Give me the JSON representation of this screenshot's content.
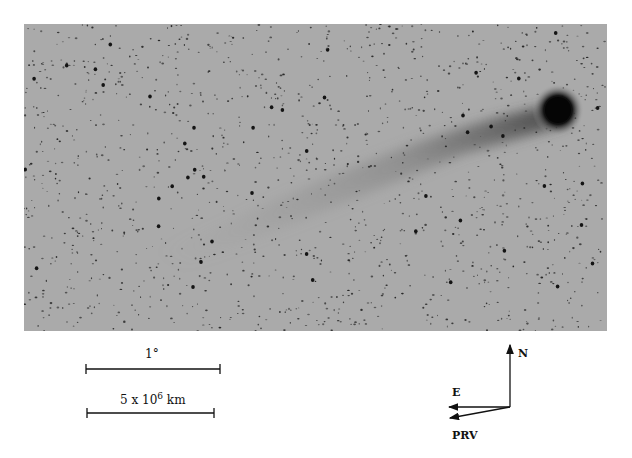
{
  "figure": {
    "image_description": "Negative (inverted) photograph of a comet with dust tail against star field",
    "background_color": "#aaaaaa",
    "comet_head": {
      "x": 534,
      "y": 86,
      "r": 16
    },
    "scale_bars": [
      {
        "label": "1°",
        "x1": 86,
        "x2": 220,
        "y": 369
      },
      {
        "label_base": "5 x 10",
        "label_exp": "6",
        "label_unit": " km",
        "x1": 87,
        "x2": 214,
        "y": 413
      }
    ],
    "compass": {
      "origin": [
        510,
        407
      ],
      "north_label": "N",
      "east_label": "E",
      "prv_label": "PRV"
    }
  }
}
